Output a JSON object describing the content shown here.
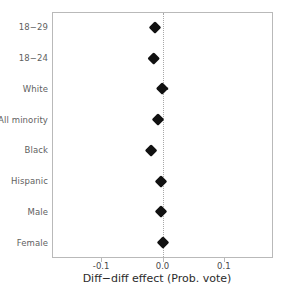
{
  "chart_data": {
    "type": "scatter",
    "title": "",
    "xlabel": "Diff−diff effect (Prob. vote)",
    "ylabel": "",
    "orientation": "horizontal",
    "xlim": [
      -0.18,
      0.18
    ],
    "xticks": [
      -0.1,
      0.0,
      0.1
    ],
    "xticklabels": [
      "-0.1",
      "0.0",
      "0.1"
    ],
    "grid": false,
    "legend": "none",
    "reference_line": {
      "x": 0.0,
      "style": "dotted",
      "color": "#a8a8a8"
    },
    "marker": "diamond",
    "marker_color": "#111111",
    "categories": [
      "18−29",
      "18−24",
      "White",
      "All minority",
      "Black",
      "Hispanic",
      "Male",
      "Female"
    ],
    "values": [
      -0.013,
      -0.015,
      0.0,
      -0.008,
      -0.018,
      -0.002,
      -0.003,
      0.0
    ],
    "ci_low": [
      -0.019,
      -0.022,
      -0.009,
      -0.013,
      -0.026,
      -0.007,
      -0.008,
      -0.005
    ],
    "ci_high": [
      -0.007,
      -0.008,
      0.01,
      -0.003,
      -0.01,
      0.003,
      0.002,
      0.005
    ],
    "points": [
      {
        "label": "18−29",
        "value": -0.013,
        "ci_low": -0.019,
        "ci_high": -0.007
      },
      {
        "label": "18−24",
        "value": -0.015,
        "ci_low": -0.022,
        "ci_high": -0.008
      },
      {
        "label": "White",
        "value": 0.0,
        "ci_low": -0.009,
        "ci_high": 0.01
      },
      {
        "label": "All minority",
        "value": -0.008,
        "ci_low": -0.013,
        "ci_high": -0.003
      },
      {
        "label": "Black",
        "value": -0.018,
        "ci_low": -0.026,
        "ci_high": -0.01
      },
      {
        "label": "Hispanic",
        "value": -0.002,
        "ci_low": -0.007,
        "ci_high": 0.003
      },
      {
        "label": "Male",
        "value": -0.003,
        "ci_low": -0.008,
        "ci_high": 0.002
      },
      {
        "label": "Female",
        "value": 0.0,
        "ci_low": -0.005,
        "ci_high": 0.005
      }
    ]
  },
  "axis": {
    "x_title": "Diff−diff effect (Prob. vote)",
    "tick_0": "-0.1",
    "tick_1": "0.0",
    "tick_2": "0.1"
  }
}
